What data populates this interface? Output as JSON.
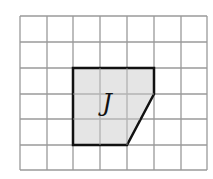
{
  "diagram": {
    "grid": {
      "cols": 7,
      "rows": 6,
      "line_color": "#9a9a9a"
    },
    "shape": {
      "label": "J",
      "fill": "#e2e2e2",
      "stroke": "#111111",
      "vertices_grid": [
        [
          2,
          2
        ],
        [
          5,
          2
        ],
        [
          5,
          3
        ],
        [
          4,
          5
        ],
        [
          2,
          5
        ]
      ]
    }
  }
}
